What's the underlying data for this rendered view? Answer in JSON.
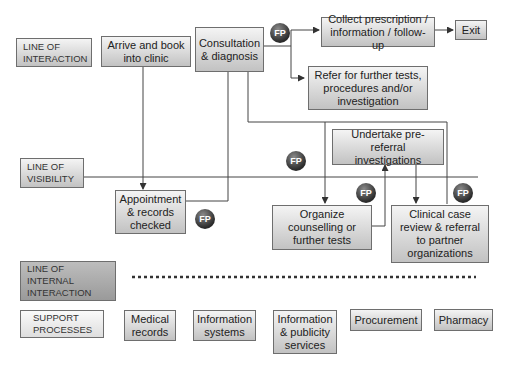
{
  "lines": {
    "interaction": "LINE OF INTERACTION",
    "visibility": "LINE OF VISIBILITY",
    "internal": "LINE OF INTERNAL INTERACTION",
    "support": "SUPPORT PROCESSES"
  },
  "steps": {
    "arrive": "Arrive and book into clinic",
    "consultation": "Consultation & diagnosis",
    "collect": "Collect prescription / information / follow-up",
    "exit": "Exit",
    "refer": "Refer for further tests, procedures and/or investigation",
    "appointment": "Appointment & records checked",
    "undertake": "Undertake pre-referral investigations",
    "organize": "Organize counselling or further tests",
    "clinical": "Clinical case review & referral to partner organizations"
  },
  "support_processes": [
    "Medical records",
    "Information systems",
    "Information & publicity services",
    "Procurement",
    "Pharmacy"
  ],
  "fail_point_label": "FP"
}
